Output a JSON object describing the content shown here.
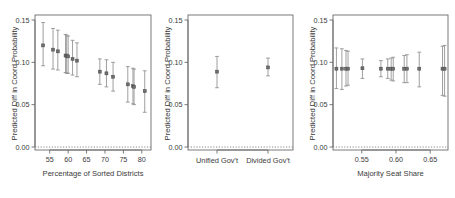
{
  "figure": {
    "background": "#ffffff",
    "point_color": "#6e6e6e",
    "errorbar_color": "#8e8e8e",
    "axis_color": "#6b6b6b",
    "zero_line_color": "#7a7a7a"
  },
  "chart_data": [
    {
      "type": "scatter",
      "panel": 1,
      "title": "",
      "xlabel": "Percentage of Sorted Districts",
      "ylabel": "Predicted Diff in Coord Probability",
      "xlim": [
        51,
        82.5
      ],
      "ylim": [
        -0.004,
        0.155
      ],
      "xticks": [
        55,
        60,
        65,
        70,
        75,
        80
      ],
      "xticklabels": [
        "55",
        "60",
        "65",
        "70",
        "75",
        "80"
      ],
      "yticks": [
        0.0,
        0.05,
        0.1,
        0.15
      ],
      "yticklabels": [
        "0.00",
        "0.05",
        "0.10",
        "0.15"
      ],
      "grid": false,
      "zero_reference_line": 0.0,
      "points": [
        {
          "x": 53.2,
          "y": 0.12,
          "lo": 0.096,
          "hi": 0.147
        },
        {
          "x": 55.9,
          "y": 0.115,
          "lo": 0.092,
          "hi": 0.14
        },
        {
          "x": 57.2,
          "y": 0.113,
          "lo": 0.091,
          "hi": 0.138
        },
        {
          "x": 59.3,
          "y": 0.108,
          "lo": 0.088,
          "hi": 0.133
        },
        {
          "x": 59.6,
          "y": 0.108,
          "lo": 0.087,
          "hi": 0.132
        },
        {
          "x": 60.0,
          "y": 0.107,
          "lo": 0.087,
          "hi": 0.131
        },
        {
          "x": 61.2,
          "y": 0.104,
          "lo": 0.085,
          "hi": 0.126
        },
        {
          "x": 62.4,
          "y": 0.102,
          "lo": 0.083,
          "hi": 0.123
        },
        {
          "x": 68.6,
          "y": 0.089,
          "lo": 0.074,
          "hi": 0.104
        },
        {
          "x": 70.4,
          "y": 0.087,
          "lo": 0.071,
          "hi": 0.103
        },
        {
          "x": 72.2,
          "y": 0.083,
          "lo": 0.066,
          "hi": 0.1
        },
        {
          "x": 76.2,
          "y": 0.074,
          "lo": 0.053,
          "hi": 0.095
        },
        {
          "x": 77.6,
          "y": 0.072,
          "lo": 0.051,
          "hi": 0.093
        },
        {
          "x": 77.9,
          "y": 0.071,
          "lo": 0.05,
          "hi": 0.092
        },
        {
          "x": 80.8,
          "y": 0.066,
          "lo": 0.041,
          "hi": 0.09
        }
      ]
    },
    {
      "type": "scatter",
      "panel": 2,
      "title": "",
      "xlabel": "",
      "ylabel": "Predicted Diff in Coord Probability",
      "ylim": [
        -0.004,
        0.155
      ],
      "yticks": [
        0.0,
        0.05,
        0.1,
        0.15
      ],
      "yticklabels": [
        "0.00",
        "0.05",
        "0.10",
        "0.15"
      ],
      "categories": [
        "Unified Gov't",
        "Divided Gov't"
      ],
      "grid": false,
      "zero_reference_line": 0.0,
      "points": [
        {
          "category": "Unified Gov't",
          "y": 0.089,
          "lo": 0.07,
          "hi": 0.107
        },
        {
          "category": "Divided Gov't",
          "y": 0.094,
          "lo": 0.084,
          "hi": 0.105
        }
      ]
    },
    {
      "type": "scatter",
      "panel": 3,
      "title": "",
      "xlabel": "Majority Seat Share",
      "ylabel": "Predicted Diff in Coord Probability",
      "xlim": [
        0.508,
        0.676
      ],
      "ylim": [
        -0.004,
        0.155
      ],
      "xticks": [
        0.55,
        0.6,
        0.65
      ],
      "xticklabels": [
        "0.55",
        "0.60",
        "0.65"
      ],
      "yticks": [
        0.0,
        0.05,
        0.1,
        0.15
      ],
      "yticklabels": [
        "0.00",
        "0.05",
        "0.10",
        "0.15"
      ],
      "grid": false,
      "zero_reference_line": 0.0,
      "points": [
        {
          "x": 0.513,
          "y": 0.0925,
          "lo": 0.069,
          "hi": 0.117
        },
        {
          "x": 0.521,
          "y": 0.0925,
          "lo": 0.068,
          "hi": 0.116
        },
        {
          "x": 0.527,
          "y": 0.0925,
          "lo": 0.072,
          "hi": 0.114
        },
        {
          "x": 0.53,
          "y": 0.0925,
          "lo": 0.073,
          "hi": 0.113
        },
        {
          "x": 0.551,
          "y": 0.093,
          "lo": 0.081,
          "hi": 0.104
        },
        {
          "x": 0.578,
          "y": 0.0925,
          "lo": 0.083,
          "hi": 0.102
        },
        {
          "x": 0.588,
          "y": 0.0925,
          "lo": 0.081,
          "hi": 0.104
        },
        {
          "x": 0.593,
          "y": 0.0925,
          "lo": 0.079,
          "hi": 0.105
        },
        {
          "x": 0.596,
          "y": 0.0925,
          "lo": 0.078,
          "hi": 0.106
        },
        {
          "x": 0.612,
          "y": 0.0925,
          "lo": 0.076,
          "hi": 0.108
        },
        {
          "x": 0.616,
          "y": 0.0925,
          "lo": 0.076,
          "hi": 0.109
        },
        {
          "x": 0.634,
          "y": 0.0925,
          "lo": 0.071,
          "hi": 0.112
        },
        {
          "x": 0.668,
          "y": 0.0925,
          "lo": 0.061,
          "hi": 0.119
        },
        {
          "x": 0.671,
          "y": 0.0925,
          "lo": 0.06,
          "hi": 0.12
        }
      ]
    }
  ]
}
